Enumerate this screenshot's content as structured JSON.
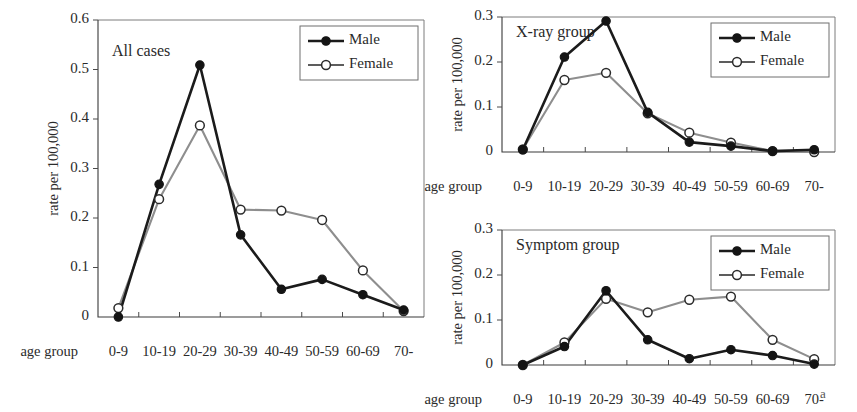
{
  "figure": {
    "shared_xlabel": "age group",
    "shared_ylabel": "rate per 100,000",
    "categories": [
      "0-9",
      "10-19",
      "20-29",
      "30-39",
      "40-49",
      "50-59",
      "60-69",
      "70-"
    ],
    "legend": {
      "male_label": "Male",
      "female_label": "Female",
      "male_color": "#141414",
      "female_color": "#8e8e8e",
      "male_marker": "filled-circle-marker",
      "female_marker": "open-circle-marker"
    }
  },
  "chart_data": [
    {
      "id": "all-cases",
      "type": "line",
      "title": "All cases",
      "xlabel": "age group",
      "ylabel": "rate per 100,000",
      "categories": [
        "0-9",
        "10-19",
        "20-29",
        "30-39",
        "40-49",
        "50-59",
        "60-69",
        "70-"
      ],
      "ylim": [
        0,
        0.6
      ],
      "yticks": [
        0,
        0.1,
        0.2,
        0.3,
        0.4,
        0.5,
        0.6
      ],
      "ytick_labels": [
        "0",
        "0.1",
        "0.2",
        "0.3",
        "0.4",
        "0.5",
        "0.6"
      ],
      "grid": false,
      "legend_position": "top-right",
      "series": [
        {
          "name": "Male",
          "values": [
            0.0,
            0.268,
            0.509,
            0.166,
            0.056,
            0.076,
            0.045,
            0.014
          ]
        },
        {
          "name": "Female",
          "values": [
            0.018,
            0.238,
            0.387,
            0.217,
            0.215,
            0.196,
            0.094,
            0.012
          ]
        }
      ]
    },
    {
      "id": "x-ray-group",
      "type": "line",
      "title": "X-ray group",
      "xlabel": "age group",
      "ylabel": "rate per 100,000",
      "categories": [
        "0-9",
        "10-19",
        "20-29",
        "30-39",
        "40-49",
        "50-59",
        "60-69",
        "70-"
      ],
      "ylim": [
        0,
        0.3
      ],
      "yticks": [
        0,
        0.1,
        0.2,
        0.3
      ],
      "ytick_labels": [
        "0",
        "0.1",
        "0.2",
        "0.3"
      ],
      "grid": false,
      "legend_position": "top-right",
      "series": [
        {
          "name": "Male",
          "values": [
            0.005,
            0.211,
            0.291,
            0.088,
            0.022,
            0.013,
            0.002,
            0.005
          ]
        },
        {
          "name": "Female",
          "values": [
            0.006,
            0.16,
            0.176,
            0.086,
            0.043,
            0.021,
            0.002,
            0.0
          ]
        }
      ]
    },
    {
      "id": "symptom-group",
      "type": "line",
      "title": "Symptom group",
      "xlabel": "age group",
      "ylabel": "rate per 100,000",
      "categories": [
        "0-9",
        "10-19",
        "20-29",
        "30-39",
        "40-49",
        "50-59",
        "60-69",
        "70-"
      ],
      "ylim": [
        0,
        0.3
      ],
      "yticks": [
        0,
        0.1,
        0.2,
        0.3
      ],
      "ytick_labels": [
        "0",
        "0.1",
        "0.2",
        "0.3"
      ],
      "grid": false,
      "legend_position": "top-right",
      "series": [
        {
          "name": "Male",
          "values": [
            0.0,
            0.041,
            0.165,
            0.056,
            0.014,
            0.034,
            0.021,
            0.002
          ]
        },
        {
          "name": "Female",
          "values": [
            0.0,
            0.05,
            0.147,
            0.117,
            0.145,
            0.152,
            0.056,
            0.013
          ]
        }
      ]
    }
  ],
  "panel_letter": "a"
}
